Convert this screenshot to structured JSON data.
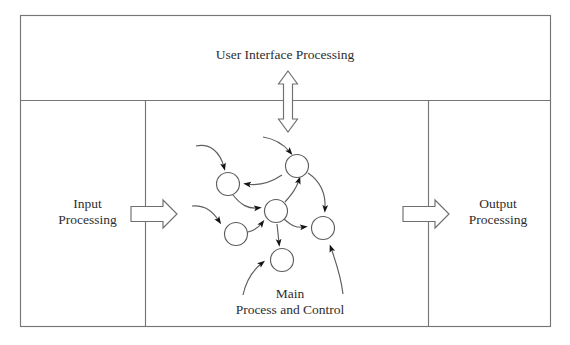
{
  "diagram": {
    "type": "block-diagram",
    "background_color": "#ffffff",
    "line_color": "#6f6f6f",
    "text_color": "#2e2e2e",
    "node_fill": "#ffffff",
    "arrow_fill": "#111111",
    "blocks": [
      {
        "id": "user-interface-processing",
        "label": "User Interface Processing",
        "position": "top-band",
        "x": 20,
        "y": 15,
        "width": 531,
        "height": 85
      },
      {
        "id": "input-processing",
        "label_line1": "Input",
        "label_line2": "Processing",
        "position": "bottom-left",
        "x": 20,
        "y": 100,
        "width": 125,
        "height": 227
      },
      {
        "id": "main-process-and-control",
        "label_line1": "Main",
        "label_line2": "Process and Control",
        "position": "bottom-center",
        "x": 145,
        "y": 100,
        "width": 283,
        "height": 227
      },
      {
        "id": "output-processing",
        "label_line1": "Output",
        "label_line2": "Processing",
        "position": "bottom-right",
        "x": 428,
        "y": 100,
        "width": 123,
        "height": 227
      }
    ],
    "connectors": [
      {
        "id": "ui-to-main",
        "style": "hollow-double-headed-vertical-arrow",
        "from": "user-interface-processing",
        "to": "main-process-and-control",
        "direction": "bidirectional",
        "x": 288,
        "y_top": 72,
        "y_bottom": 132
      },
      {
        "id": "input-to-main",
        "style": "hollow-right-arrow",
        "from": "input-processing",
        "to": "main-process-and-control",
        "direction": "right",
        "x_start": 131,
        "x_end": 176,
        "y": 214
      },
      {
        "id": "main-to-output",
        "style": "hollow-right-arrow",
        "from": "main-process-and-control",
        "to": "output-processing",
        "direction": "right",
        "x_start": 403,
        "x_end": 448,
        "y": 214
      }
    ],
    "process_network": {
      "description": "Cluster of interconnected process nodes with curved directed arcs",
      "node_count": 6,
      "node_radius": 11.5,
      "nodes": [
        {
          "id": "n1",
          "cx": 228,
          "cy": 184
        },
        {
          "id": "n2",
          "cx": 297,
          "cy": 166
        },
        {
          "id": "n3",
          "cx": 276,
          "cy": 211
        },
        {
          "id": "n4",
          "cx": 236,
          "cy": 234
        },
        {
          "id": "n5",
          "cx": 323,
          "cy": 228
        },
        {
          "id": "n6",
          "cx": 282,
          "cy": 260
        }
      ],
      "internal_arcs": [
        {
          "from": "n2",
          "to": "n1",
          "note": "curve to upper-left node"
        },
        {
          "from": "n1",
          "to": "n3",
          "note": "down-right into center node"
        },
        {
          "from": "n3",
          "to": "n2",
          "note": "up-right into top node"
        },
        {
          "from": "n3",
          "to": "n5",
          "note": "right into right node"
        },
        {
          "from": "n4",
          "to": "n3",
          "note": "right into center node"
        },
        {
          "from": "n3",
          "to": "n6",
          "note": "straight down into bottom node"
        },
        {
          "from": "n2",
          "to": "n5",
          "note": "down the right side"
        }
      ],
      "external_arcs": [
        {
          "id": "ext-top-left",
          "to": "n1",
          "enters": "top",
          "note": "incoming from upper left"
        },
        {
          "id": "ext-top-center",
          "to": "n2",
          "enters": "top-left",
          "note": "incoming from the user interface arrow"
        },
        {
          "id": "ext-left",
          "to": "n4",
          "enters": "top-left",
          "note": "incoming from the left"
        },
        {
          "id": "ext-bottom-left",
          "to": "n6",
          "enters": "left",
          "note": "incoming from below left"
        },
        {
          "id": "ext-bottom-right",
          "to": "n5",
          "enters": "bottom-right",
          "note": "incoming from below right"
        }
      ]
    }
  }
}
